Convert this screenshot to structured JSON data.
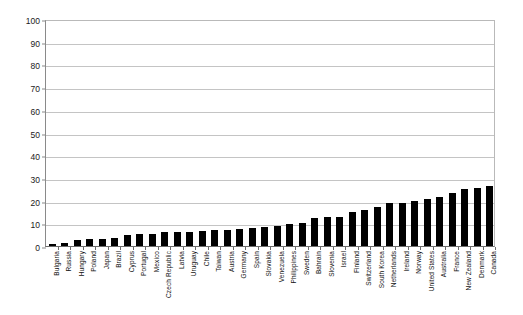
{
  "chart_data": {
    "type": "bar",
    "title": "",
    "subtitle": "",
    "xlabel": "",
    "ylabel": "",
    "ylim": [
      0,
      100
    ],
    "ytick_step": 10,
    "yticks": [
      "0",
      "10",
      "20",
      "30",
      "40",
      "50",
      "60",
      "70",
      "80",
      "90",
      "100"
    ],
    "grid": true,
    "legend": "none",
    "bar_color": "#000000",
    "categories": [
      "Bulgaria",
      "Russia",
      "Hungary",
      "Poland",
      "Japan",
      "Brazil",
      "Cyprus",
      "Portugal",
      "Mexico",
      "Czech Republic",
      "Latvia",
      "Uruguay",
      "Chile",
      "Taiwan",
      "Austria",
      "Germany",
      "Spain",
      "Slovakia",
      "Venezuela",
      "Philippines",
      "Sweden",
      "Bahrain",
      "Slovenia",
      "Israel",
      "Finland",
      "Switzerland",
      "South Korea",
      "Netherlands",
      "Ireland",
      "Norway",
      "United States",
      "Australia",
      "France",
      "New Zealand",
      "Denmark",
      "Canada"
    ],
    "values": [
      1.0,
      1.5,
      2.5,
      3.0,
      3.0,
      3.5,
      5.0,
      5.5,
      5.5,
      6.0,
      6.0,
      6.0,
      6.5,
      7.0,
      7.0,
      7.5,
      8.0,
      8.5,
      9.0,
      9.5,
      10.0,
      12.5,
      13.0,
      13.0,
      15.0,
      16.0,
      17.0,
      19.0,
      19.0,
      20.0,
      20.5,
      21.5,
      23.5,
      25.0,
      25.5,
      26.5
    ]
  }
}
